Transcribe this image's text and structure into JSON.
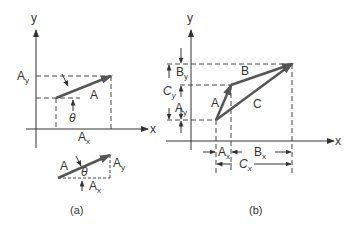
{
  "figure": {
    "panel_a": {
      "caption": "(a)",
      "axis_x_label": "x",
      "axis_y_label": "y",
      "vector_label": "A",
      "angle_label": "θ",
      "component_x_label": {
        "base": "A",
        "sub": "x"
      },
      "component_y_label": {
        "base": "A",
        "sub": "y"
      },
      "inset": {
        "vector_label": "A",
        "angle_label": "θ",
        "component_x_label": {
          "base": "A",
          "sub": "x"
        },
        "component_y_label": {
          "base": "A",
          "sub": "y"
        }
      }
    },
    "panel_b": {
      "caption": "(b)",
      "axis_x_label": "x",
      "axis_y_label": "y",
      "vector_labels": [
        "A",
        "B",
        "C"
      ],
      "dim_labels_y": [
        {
          "base": "B",
          "sub": "y"
        },
        {
          "base": "C",
          "sub": "y"
        },
        {
          "base": "A",
          "sub": "y"
        }
      ],
      "dim_labels_x": [
        {
          "base": "A",
          "sub": "x"
        },
        {
          "base": "B",
          "sub": "x"
        },
        {
          "base": "C",
          "sub": "x"
        }
      ]
    },
    "colors": {
      "line": "#333333",
      "vector": "#555555",
      "dashed": "#444444"
    }
  }
}
